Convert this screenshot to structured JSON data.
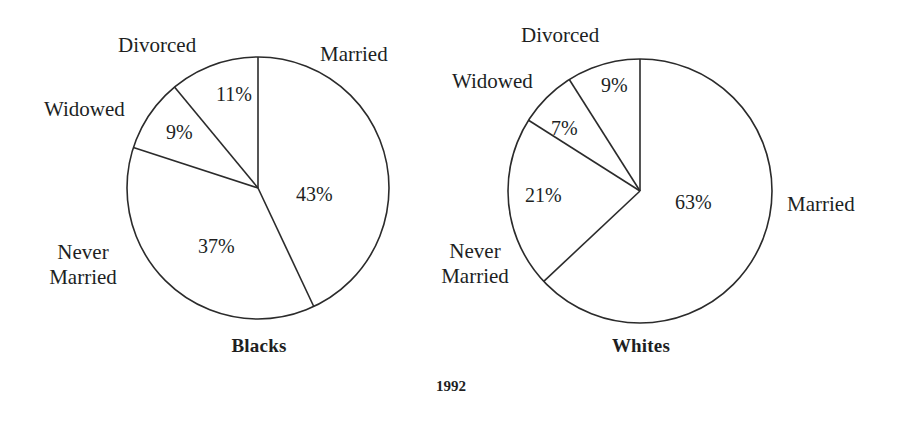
{
  "figure": {
    "caption": "1992",
    "background": "#ffffff",
    "stroke_color": "#2b2b2b",
    "text_color": "#211f1f"
  },
  "chart_data": [
    {
      "type": "pie",
      "title": "Blacks",
      "categories": [
        "Married",
        "Never Married",
        "Widowed",
        "Divorced"
      ],
      "values": [
        43,
        37,
        9,
        11
      ],
      "value_labels": [
        "43%",
        "37%",
        "9%",
        "11%"
      ],
      "unit": "%",
      "start_angle_deg": 0,
      "direction": "clockwise",
      "center": {
        "x": 258,
        "y": 188
      },
      "radius": 131,
      "legend": "none",
      "grid": false
    },
    {
      "type": "pie",
      "title": "Whites",
      "categories": [
        "Married",
        "Never Married",
        "Widowed",
        "Divorced"
      ],
      "values": [
        63,
        21,
        7,
        9
      ],
      "value_labels": [
        "63%",
        "21%",
        "7%",
        "9%"
      ],
      "unit": "%",
      "start_angle_deg": 0,
      "direction": "clockwise",
      "center": {
        "x": 640,
        "y": 191
      },
      "radius": 132,
      "legend": "none",
      "grid": false
    }
  ],
  "left_chart": {
    "title": "Blacks",
    "labels": {
      "married": "Married",
      "never_married_line1": "Never",
      "never_married_line2": "Married",
      "widowed": "Widowed",
      "divorced": "Divorced"
    },
    "percents": {
      "married": "43%",
      "never_married": "37%",
      "widowed": "9%",
      "divorced": "11%"
    }
  },
  "right_chart": {
    "title": "Whites",
    "labels": {
      "married": "Married",
      "never_married_line1": "Never",
      "never_married_line2": "Married",
      "widowed": "Widowed",
      "divorced": "Divorced"
    },
    "percents": {
      "married": "63%",
      "never_married": "21%",
      "widowed": "7%",
      "divorced": "9%"
    }
  }
}
